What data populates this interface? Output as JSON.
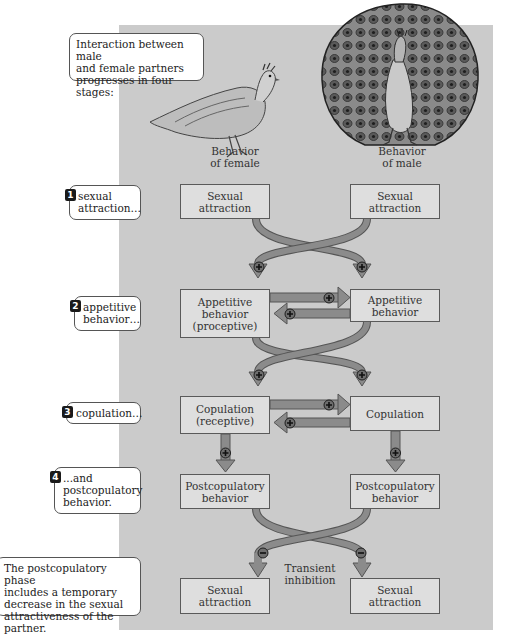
{
  "intro_callout": {
    "lines": [
      "Interaction between male",
      "and female partners",
      "progresses in four stages:"
    ]
  },
  "column_labels": {
    "female": [
      "Behavior",
      "of female"
    ],
    "male": [
      "Behavior",
      "of male"
    ]
  },
  "stages": [
    {
      "number": "1",
      "lines": [
        "sexual",
        "attraction…"
      ]
    },
    {
      "number": "2",
      "lines": [
        "appetitive",
        "behavior…"
      ]
    },
    {
      "number": "3",
      "lines": [
        "copulation…"
      ]
    },
    {
      "number": "4",
      "lines": [
        "...and",
        "postcopulatory",
        "behavior."
      ]
    }
  ],
  "footer_callout": {
    "lines": [
      "The postcopulatory phase",
      "includes a temporary",
      "decrease in the sexual",
      "attractiveness of the partner."
    ]
  },
  "boxes": {
    "female": [
      [
        "Sexual",
        "attraction"
      ],
      [
        "Appetitive",
        "behavior",
        "(proceptive)"
      ],
      [
        "Copulation",
        "(receptive)"
      ],
      [
        "Postcopulatory",
        "behavior"
      ],
      [
        "Sexual",
        "attraction"
      ]
    ],
    "male": [
      [
        "Sexual",
        "attraction"
      ],
      [
        "Appetitive",
        "behavior"
      ],
      [
        "Copulation"
      ],
      [
        "Postcopulatory",
        "behavior"
      ],
      [
        "Sexual",
        "attraction"
      ]
    ]
  },
  "signs": {
    "positive": "+",
    "negative": "−"
  },
  "inhibition_label": [
    "Transient",
    "inhibition"
  ],
  "colors": {
    "panel": "#cbcbcb",
    "box_fill": "#dedede",
    "arrow_fill": "#8b8b8b",
    "arrow_stroke": "#555555",
    "badge": "#1a1a1a"
  }
}
